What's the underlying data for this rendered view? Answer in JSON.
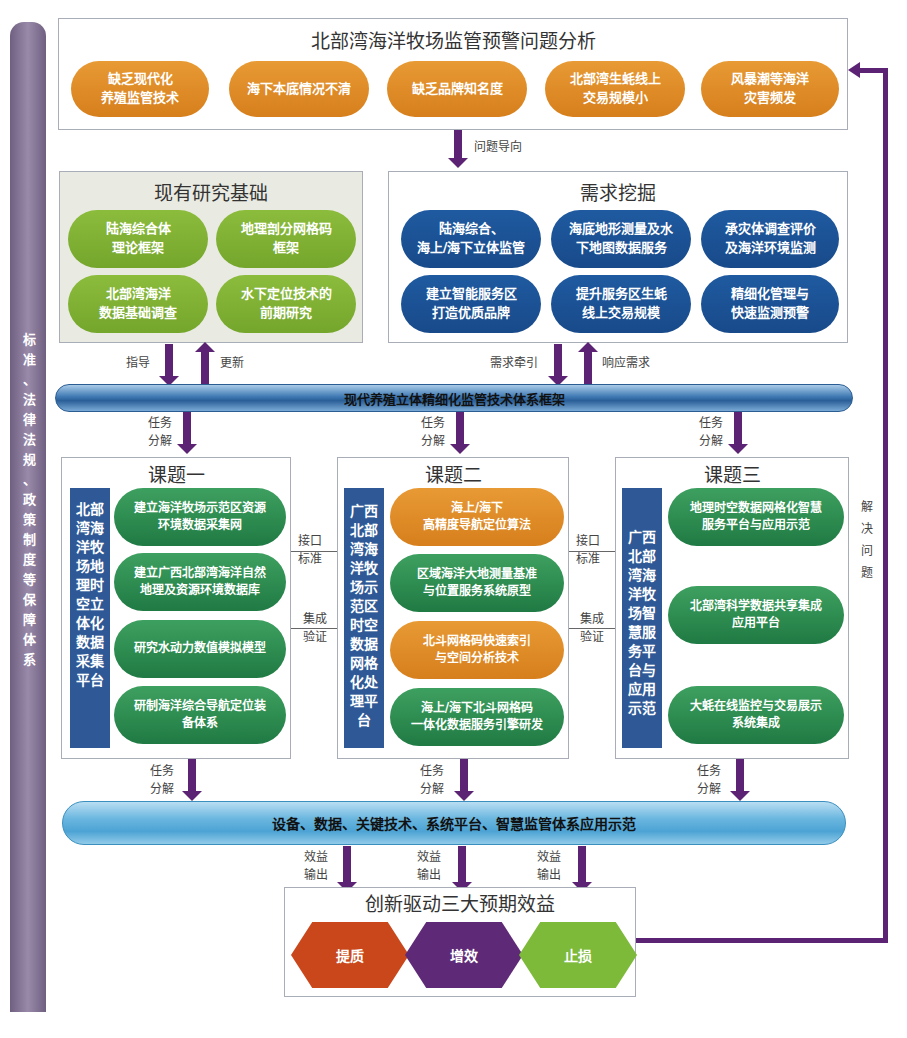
{
  "side_bar": {
    "label": "标\n准\n、\n法\n律\n法\n规\n、\n政\n策\n制\n度\n等\n保\n障\n体\n系"
  },
  "problems": {
    "title": "北部湾海洋牧场监管预警问题分析",
    "items": [
      "缺乏现代化\n养殖监管技术",
      "海下本底情况不清",
      "缺乏品牌知名度",
      "北部湾生蚝线上\n交易规模小",
      "风暴潮等海洋\n灾害频发"
    ]
  },
  "arrows": {
    "problem_oriented": "问题导向",
    "guide": "指导",
    "update": "更新",
    "demand_pull": "需求牵引",
    "respond": "响应需求",
    "task_decompose": "任务\n分解",
    "interface": "接口\n标准",
    "integrate": "集成\n验证",
    "benefit_out": "效益\n输出",
    "solve": "解\n决\n问\n题"
  },
  "research": {
    "title": "现有研究基础",
    "items": [
      "陆海综合体\n理论框架",
      "地理剖分网格码\n框架",
      "北部湾海洋\n数据基础调查",
      "水下定位技术的\n前期研究"
    ]
  },
  "demand": {
    "title": "需求挖掘",
    "items": [
      "陆海综合、\n海上/海下立体监管",
      "海底地形测量及水\n下地图数据服务",
      "承灾体调查评价\n及海洋环境监测",
      "建立智能服务区\n打造优质品牌",
      "提升服务区生蚝\n线上交易规模",
      "精细化管理与\n快速监测预警"
    ]
  },
  "framework": {
    "label": "现代养殖立体精细化监管技术体系框架"
  },
  "topic1": {
    "title": "课题一",
    "side": "北部\n湾海\n洋牧\n场地\n理时\n空立\n体化\n数据\n采集\n平台",
    "items": [
      "建立海洋牧场示范区资源\n环境数据采集网",
      "建立广西北部湾海洋自然\n地理及资源环境数据库",
      "研究水动力数值模拟模型",
      "研制海洋综合导航定位装\n备体系"
    ]
  },
  "topic2": {
    "title": "课题二",
    "side": "广西\n北部\n湾海\n洋牧\n场示\n范区\n时空\n数据\n网格\n化处\n理平\n台",
    "items": [
      "海上/海下\n高精度导航定位算法",
      "区域海洋大地测量基准\n与位置服务系统原型",
      "北斗网格码快速索引\n与空间分析技术",
      "海上/海下北斗网格码\n一体化数据服务引擎研发"
    ]
  },
  "topic3": {
    "title": "课题三",
    "side": "广西\n北部\n湾海\n洋牧\n场智\n慧服\n务平\n台与\n应用\n示范",
    "items": [
      "地理时空数据网格化智慧\n服务平台与应用示范",
      "北部湾科学数据共享集成\n应用平台",
      "大蚝在线监控与交易展示\n系统集成"
    ]
  },
  "application": {
    "label": "设备、数据、关键技术、系统平台、智慧监管体系应用示范"
  },
  "benefits": {
    "title": "创新驱动三大预期效益",
    "items": [
      {
        "label": "提质",
        "color": "#c9471a"
      },
      {
        "label": "增效",
        "color": "#5e2a78"
      },
      {
        "label": "止损",
        "color": "#7dba3a"
      }
    ]
  },
  "colors": {
    "arrow": "#5c2273",
    "orange": "#e08a28",
    "blue": "#1f5aa0",
    "green": "#2a8a4d",
    "lightgreen": "#80b236",
    "sidebar": "#8a7a9a"
  }
}
